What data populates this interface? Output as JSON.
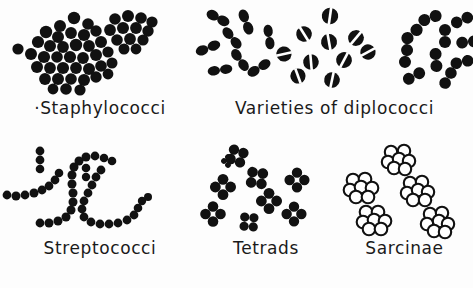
{
  "figure": {
    "background_color": "#fdfdfd",
    "ink_color": "#111111",
    "panels": [
      {
        "id": "staphylococci",
        "caption": "Staphylococci",
        "caption_prefix_mark": "·",
        "morphology": "irregular grape-like clusters of solid round cocci",
        "cell_style": "solid filled circle",
        "cluster_count": 2
      },
      {
        "id": "diplococci",
        "caption": "Varieties of diplococci",
        "morphology": "three groups of paired cocci",
        "groups": [
          {
            "name": "lancet-shaped diplococci",
            "cell_style": "solid elongated oval pair",
            "pair_count": 8
          },
          {
            "name": "split diplococci",
            "cell_style": "round cell with white dividing cleft",
            "pair_count": 10
          },
          {
            "name": "round diplococci",
            "cell_style": "two touching solid circles",
            "pair_count": 10
          }
        ]
      },
      {
        "id": "streptococci",
        "caption": "Streptococci",
        "morphology": "long curving chains of round cocci",
        "cell_style": "solid filled circle",
        "chain_count": 4
      },
      {
        "id": "tetrads",
        "caption": "Tetrads",
        "morphology": "groups of four cocci in a square packet",
        "cell_style": "four solid circles around a white centre",
        "packet_count": 9
      },
      {
        "id": "sarcinae",
        "caption": "Sarcinae",
        "morphology": "cubical packets of eight cocci",
        "cell_style": "outlined white circle with black rim",
        "packet_count": 5
      }
    ]
  }
}
